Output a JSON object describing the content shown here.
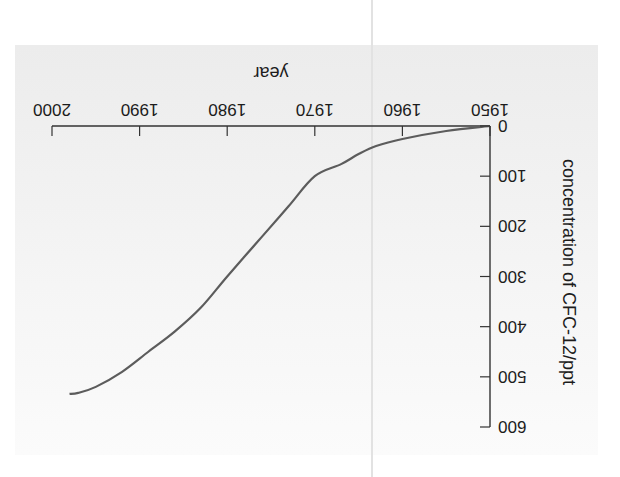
{
  "chart_data": {
    "type": "line",
    "title": "",
    "xlabel": "year",
    "ylabel": "concentration of CFC-12/ppt",
    "xlim": [
      1950,
      2000
    ],
    "ylim": [
      0,
      600
    ],
    "x_ticks": [
      "1950",
      "1960",
      "1970",
      "1980",
      "1990",
      "2000"
    ],
    "y_ticks": [
      "0",
      "100",
      "200",
      "300",
      "400",
      "500",
      "600"
    ],
    "grid": false,
    "legend": null,
    "orientation_note": "figure displayed rotated 180 degrees",
    "series": [
      {
        "name": "CFC-12",
        "x": [
          1950,
          1955,
          1960,
          1963,
          1965,
          1967,
          1970,
          1973,
          1976,
          1980,
          1983,
          1986,
          1989,
          1992,
          1995,
          1997,
          1998
        ],
        "values": [
          0,
          10,
          26,
          40,
          56,
          76,
          100,
          160,
          220,
          300,
          362,
          410,
          450,
          490,
          520,
          532,
          534
        ]
      }
    ],
    "colors": {
      "line": "#5a5a5a",
      "axis": "#333333",
      "plot_bg": "#eeeeee"
    }
  }
}
